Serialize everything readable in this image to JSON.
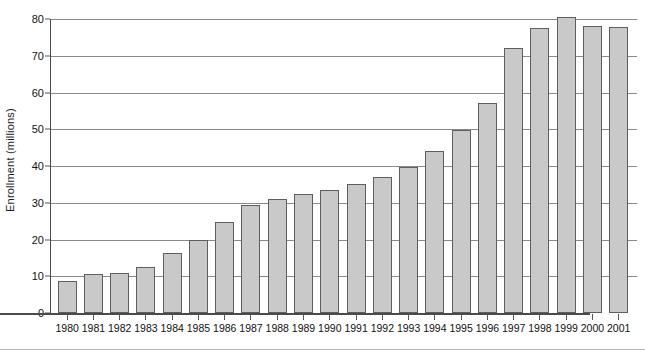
{
  "chart_data": {
    "type": "bar",
    "title": "",
    "xlabel": "",
    "ylabel": "Enrollment  (millions)",
    "ylim": [
      0,
      80
    ],
    "yticks": [
      0,
      10,
      20,
      30,
      40,
      50,
      60,
      70,
      80
    ],
    "grid": "horizontal",
    "legend": "none",
    "bar_color": "#c9c9c9",
    "bar_edge_color": "#5e5e5e",
    "axis_color": "#4a4a4a",
    "grid_color": "#8a8a8a",
    "categories": [
      "1980",
      "1981",
      "1982",
      "1983",
      "1984",
      "1985",
      "1986",
      "1987",
      "1988",
      "1989",
      "1990",
      "1991",
      "1992",
      "1993",
      "1994",
      "1995",
      "1996",
      "1997",
      "1998",
      "1999",
      "2000",
      "2001"
    ],
    "values": [
      8.8,
      10.5,
      10.8,
      12.5,
      16.2,
      20.0,
      24.8,
      29.3,
      31.0,
      32.5,
      33.6,
      35.0,
      37.0,
      39.8,
      44.0,
      49.8,
      57.2,
      72.0,
      77.6,
      80.6,
      78.2,
      77.8
    ]
  }
}
